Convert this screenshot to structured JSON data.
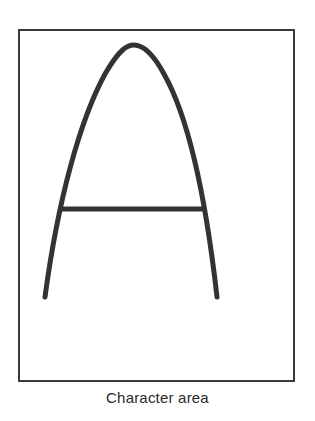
{
  "figure": {
    "caption": "Character area",
    "glyph": "A",
    "colors": {
      "background": "#ffffff",
      "frame": "#3a3a3a",
      "stroke": "#333333",
      "caption": "#2a2a2a"
    }
  }
}
